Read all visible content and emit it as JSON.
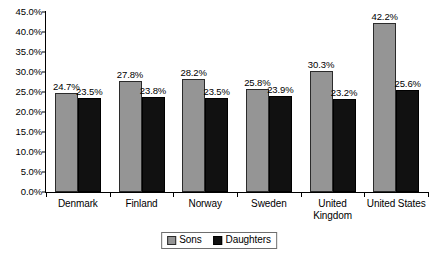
{
  "chart_data": {
    "type": "bar",
    "title": "",
    "subtitle": "",
    "xlabel": "",
    "ylabel": "",
    "ylim": [
      0,
      45
    ],
    "ytick_step": 5,
    "ytick_labels": [
      "45.0%",
      "40.0%",
      "35.0%",
      "30.0%",
      "25.0%",
      "20.0%",
      "15.0%",
      "10.0%",
      "5.0%",
      "0.0%"
    ],
    "ytick_values": [
      45,
      40,
      35,
      30,
      25,
      20,
      15,
      10,
      5,
      0
    ],
    "grid": false,
    "legend_position": "bottom",
    "categories": [
      "Denmark",
      "Finland",
      "Norway",
      "Sweden",
      "United Kingdom",
      "United States"
    ],
    "series": [
      {
        "name": "Sons",
        "color": "#959595",
        "values": [
          24.7,
          27.8,
          28.2,
          25.8,
          30.3,
          42.2
        ],
        "labels": [
          "24.7%",
          "27.8%",
          "28.2%",
          "25.8%",
          "30.3%",
          "42.2%"
        ]
      },
      {
        "name": "Daughters",
        "color": "#111111",
        "values": [
          23.5,
          23.8,
          23.5,
          23.9,
          23.2,
          25.6
        ],
        "labels": [
          "23.5%",
          "23.8%",
          "23.5%",
          "23.9%",
          "23.2%",
          "25.6%"
        ]
      }
    ]
  },
  "axis": {
    "ticks": [
      {
        "label": "45.0%",
        "value": 45
      },
      {
        "label": "40.0%",
        "value": 40
      },
      {
        "label": "35.0%",
        "value": 35
      },
      {
        "label": "30.0%",
        "value": 30
      },
      {
        "label": "25.0%",
        "value": 25
      },
      {
        "label": "20.0%",
        "value": 20
      },
      {
        "label": "15.0%",
        "value": 15
      },
      {
        "label": "10.0%",
        "value": 10
      },
      {
        "label": "5.0%",
        "value": 5
      },
      {
        "label": "0.0%",
        "value": 0
      }
    ]
  },
  "categories_display": [
    {
      "line1": "Denmark",
      "line2": ""
    },
    {
      "line1": "Finland",
      "line2": ""
    },
    {
      "line1": "Norway",
      "line2": ""
    },
    {
      "line1": "Sweden",
      "line2": ""
    },
    {
      "line1": "United",
      "line2": "Kingdom"
    },
    {
      "line1": "United States",
      "line2": ""
    }
  ],
  "legend": {
    "items": [
      {
        "label": "Sons",
        "swatch": "sons"
      },
      {
        "label": "Daughters",
        "swatch": "daughters"
      }
    ]
  }
}
